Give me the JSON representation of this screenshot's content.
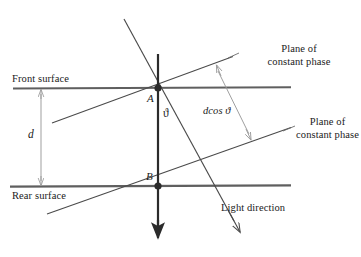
{
  "figure": {
    "type": "optics-ray-diagram",
    "background_color": "#ffffff",
    "line_color": "#3a3a3a",
    "surface_color": "#555555",
    "dimension_color": "#8a8a8a",
    "text_color": "#1a1a1a"
  },
  "labels": {
    "front_surface": "Front surface",
    "rear_surface": "Rear surface",
    "thickness": "d",
    "node_a": "A",
    "node_b": "B",
    "angle": "ϑ",
    "path_difference": "dcos ϑ",
    "plane_upper_line1": "Plane of",
    "plane_upper_line2": "constant phase",
    "plane_lower_line1": "Plane of",
    "plane_lower_line2": "constant phase",
    "light_direction": "Light direction"
  },
  "geometry": {
    "node_a": {
      "x": 158,
      "y": 88
    },
    "node_b": {
      "x": 158,
      "y": 186
    },
    "front_surface_y": 88,
    "rear_surface_y": 186,
    "thickness_px": 98,
    "normal_arrow_from": {
      "x": 158,
      "y": 55
    },
    "normal_arrow_to": {
      "x": 158,
      "y": 240
    },
    "light_ray_from": {
      "x": 124,
      "y": 19
    },
    "light_ray_to": {
      "x": 238,
      "y": 228
    },
    "plane_upper_from": {
      "x": 52,
      "y": 123
    },
    "plane_upper_to": {
      "x": 232,
      "y": 57
    },
    "plane_lower_from": {
      "x": 47,
      "y": 214
    },
    "plane_lower_to": {
      "x": 290,
      "y": 128
    },
    "dcos_arrow_from": {
      "x": 217,
      "y": 66
    },
    "dcos_arrow_to": {
      "x": 251,
      "y": 139
    }
  }
}
